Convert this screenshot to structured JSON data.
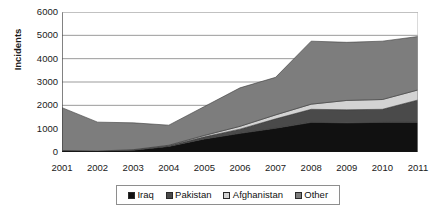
{
  "chart_data": {
    "type": "area",
    "stacked": true,
    "title": "",
    "subtitle": "",
    "xlabel": "",
    "ylabel": "Incidents",
    "x": [
      2001,
      2002,
      2003,
      2004,
      2005,
      2006,
      2007,
      2008,
      2009,
      2010,
      2011
    ],
    "categories": [
      "2001",
      "2002",
      "2003",
      "2004",
      "2005",
      "2006",
      "2007",
      "2008",
      "2009",
      "2010",
      "2011"
    ],
    "series": [
      {
        "name": "Iraq",
        "color": "#111111",
        "values": [
          60,
          40,
          80,
          240,
          560,
          800,
          1020,
          1270,
          1250,
          1270,
          1280
        ]
      },
      {
        "name": "Pakistan",
        "color": "#4a4a4a",
        "values": [
          0,
          0,
          10,
          30,
          90,
          180,
          400,
          560,
          560,
          560,
          950
        ]
      },
      {
        "name": "Afghanistan",
        "color": "#d3d3d3",
        "values": [
          0,
          0,
          10,
          20,
          60,
          120,
          170,
          220,
          400,
          420,
          430
        ]
      },
      {
        "name": "Other",
        "color": "#7d7d7d",
        "values": [
          1840,
          1240,
          1150,
          860,
          1240,
          1650,
          1610,
          2700,
          2490,
          2500,
          2290
        ]
      }
    ],
    "totals": [
      1900,
      1280,
      1250,
      1150,
      1950,
      2750,
      3200,
      4750,
      4700,
      4750,
      4950
    ],
    "ylim": [
      0,
      6000
    ],
    "yticks": [
      0,
      1000,
      2000,
      3000,
      4000,
      5000,
      6000
    ],
    "ytick_labels": [
      "0",
      "1000",
      "2000",
      "3000",
      "4000",
      "5000",
      "6000"
    ],
    "xlim": [
      2001,
      2011
    ],
    "grid": "horizontal",
    "legend_position": "bottom",
    "legend": [
      "Iraq",
      "Pakistan",
      "Afghanistan",
      "Other"
    ]
  },
  "legend": {
    "items": [
      {
        "label": "Iraq",
        "swatch": "legend-swatch-iraq"
      },
      {
        "label": "Pakistan",
        "swatch": "legend-swatch-pakistan"
      },
      {
        "label": "Afghanistan",
        "swatch": "legend-swatch-afghanistan"
      },
      {
        "label": "Other",
        "swatch": "legend-swatch-other"
      }
    ]
  },
  "colors": {
    "iraq": "#111111",
    "pakistan": "#4a4a4a",
    "afghanistan": "#d3d3d3",
    "other": "#7d7d7d",
    "axis": "#4d4d4d",
    "grid": "#9b9b9b",
    "background": "#ffffff",
    "text": "#1a1a1a"
  }
}
